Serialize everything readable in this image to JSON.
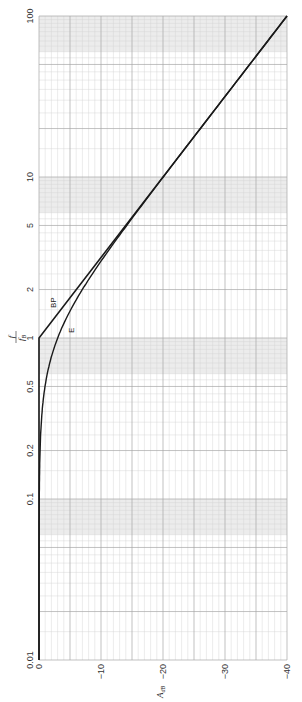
{
  "chart_data": {
    "type": "line",
    "orientation": "rotated-90-ccw",
    "title": "",
    "xlabel": "f / f_B",
    "ylabel": "A_dB",
    "x_scale": "log",
    "xlim": [
      0.01,
      100
    ],
    "ylim": [
      0,
      -40
    ],
    "x_ticks": [
      0.01,
      0.1,
      0.2,
      0.5,
      1,
      2,
      5,
      10,
      100
    ],
    "x_tick_labels": [
      "0.01",
      "0.1",
      "0.2",
      "0.5",
      "1",
      "2",
      "5",
      "10",
      "100"
    ],
    "y_ticks": [
      0,
      -10,
      -20,
      -30,
      -40
    ],
    "y_tick_labels": [
      "0",
      "−10",
      "−20",
      "−30",
      "−40"
    ],
    "grid": true,
    "series": [
      {
        "name": "BP",
        "description": "Bode plot asymptote",
        "x": [
          0.01,
          1,
          100
        ],
        "values": [
          0,
          0,
          -40
        ]
      },
      {
        "name": "E",
        "description": "Exact response",
        "x": [
          0.01,
          0.1,
          0.2,
          0.3,
          0.5,
          0.7,
          1,
          1.5,
          2,
          3,
          5,
          7,
          10,
          20,
          50,
          100
        ],
        "values": [
          0,
          -0.04,
          -0.17,
          -0.37,
          -0.97,
          -1.74,
          -3.01,
          -5.12,
          -6.99,
          -10.0,
          -14.15,
          -17.0,
          -20.04,
          -26.02,
          -33.98,
          -40.0
        ]
      }
    ],
    "shaded_bands": [
      [
        0.06,
        0.1
      ],
      [
        0.6,
        1
      ],
      [
        6,
        10
      ],
      [
        60,
        100
      ]
    ]
  },
  "labels": {
    "bp": "BP",
    "e": "E",
    "x_axis_num": "f",
    "x_axis_den": "f",
    "x_axis_den_sub": "B",
    "y_axis": "A",
    "y_axis_sub": "dB"
  },
  "colors": {
    "curve": "#1a1a1a",
    "grid_minor": "#d4d4d4",
    "grid_major": "#a8a8a8",
    "band": "#ececec"
  }
}
